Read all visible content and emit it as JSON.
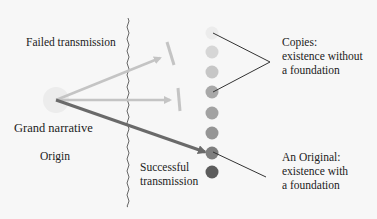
{
  "labels": {
    "failed": "Failed transmission",
    "grand_narrative": "Grand narrative",
    "origin": "Origin",
    "successful_line1": "Successful",
    "successful_line2": "transmission",
    "copies_line1": "Copies:",
    "copies_line2": "existence without",
    "copies_line3": "a foundation",
    "original_line1": "An Original:",
    "original_line2": "existence with",
    "original_line3": "a foundation"
  },
  "colors": {
    "background": "#f7f7f7",
    "failed_arrow": "#c4c4c4",
    "successful_arrow": "#6a6a6a",
    "origin_circle": "#ececec",
    "pointer_lines": "#333333",
    "divider": "#555555"
  },
  "dots": [
    {
      "y": 33,
      "color": "#ececec"
    },
    {
      "y": 52,
      "color": "#d6d6d6"
    },
    {
      "y": 72,
      "color": "#c6c6c6"
    },
    {
      "y": 92,
      "color": "#a8a8a8"
    },
    {
      "y": 113,
      "color": "#a2a2a2"
    },
    {
      "y": 133,
      "color": "#959595"
    },
    {
      "y": 153,
      "color": "#7e7e7e"
    },
    {
      "y": 172,
      "color": "#5c5c5c"
    }
  ]
}
